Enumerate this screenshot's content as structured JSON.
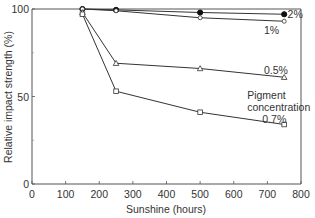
{
  "chart_data": {
    "type": "line",
    "title": "",
    "xlabel": "Sunshine (hours)",
    "ylabel": "Relative impact strength (%)",
    "xlim": [
      0,
      800
    ],
    "ylim": [
      0,
      100
    ],
    "x_ticks": [
      0,
      100,
      200,
      300,
      400,
      500,
      600,
      700,
      800
    ],
    "y_ticks": [
      0,
      50,
      100
    ],
    "y_minor_ticks": [
      25,
      75
    ],
    "grid": false,
    "x": [
      150,
      250,
      500,
      750
    ],
    "series": [
      {
        "name": "2%",
        "marker": "filled-circle",
        "values": [
          100,
          99.5,
          98,
          97
        ]
      },
      {
        "name": "1%",
        "marker": "open-circle",
        "values": [
          100,
          99,
          95,
          93
        ]
      },
      {
        "name": "0.5%",
        "marker": "open-triangle",
        "values": [
          98,
          69,
          66,
          61
        ]
      },
      {
        "name": "0.7%",
        "marker": "open-square",
        "values": [
          97,
          53,
          41,
          34
        ]
      }
    ],
    "annotations": [
      {
        "text": "2%",
        "x": 760,
        "y": 97
      },
      {
        "text": "1%",
        "x": 690,
        "y": 88
      },
      {
        "text": "0.5%",
        "x": 690,
        "y": 65
      },
      {
        "text": "Pigment",
        "x": 640,
        "y": 51
      },
      {
        "text": "concentration",
        "x": 640,
        "y": 44
      },
      {
        "text": "0.7%",
        "x": 685,
        "y": 37
      }
    ],
    "legend": "none (inline labels)",
    "line_color": "#333333"
  }
}
